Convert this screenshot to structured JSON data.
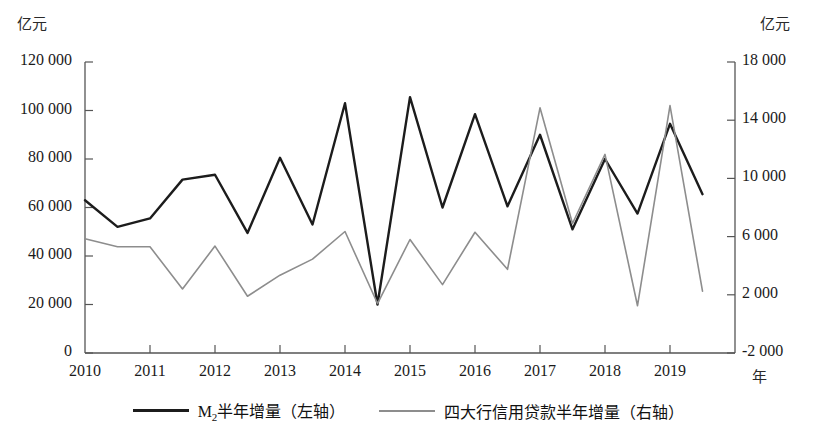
{
  "chart_data": {
    "type": "line",
    "title": "",
    "subtitle": "",
    "xlabel": "年",
    "ylabel_left": "亿元",
    "ylabel_right": "亿元",
    "grid": false,
    "legend_position": "bottom",
    "x_tick_labels": [
      "2010",
      "2011",
      "2012",
      "2013",
      "2014",
      "2015",
      "2016",
      "2017",
      "2018",
      "2019"
    ],
    "x_tick_values": [
      2010,
      2011,
      2012,
      2013,
      2014,
      2015,
      2016,
      2017,
      2018,
      2019
    ],
    "y_left_tick_labels": [
      "120 000",
      "100 000",
      "80 000",
      "60 000",
      "40 000",
      "20 000",
      "0"
    ],
    "y_left_tick_values": [
      120000,
      100000,
      80000,
      60000,
      40000,
      20000,
      0
    ],
    "y_right_tick_labels": [
      "18 000",
      "14 000",
      "10 000",
      "6 000",
      "2 000",
      "-2 000"
    ],
    "y_right_tick_values": [
      18000,
      14000,
      10000,
      6000,
      2000,
      -2000
    ],
    "ylim_left": [
      0,
      120000
    ],
    "ylim_right": [
      -2000,
      18000
    ],
    "xlim": [
      2010,
      2020
    ],
    "x": [
      2010.0,
      2010.5,
      2011.0,
      2011.5,
      2012.0,
      2012.5,
      2013.0,
      2013.5,
      2014.0,
      2014.5,
      2015.0,
      2015.5,
      2016.0,
      2016.5,
      2017.0,
      2017.5,
      2018.0,
      2018.5,
      2019.0,
      2019.5
    ],
    "x_period_labels": [
      "2010H1",
      "2010H2",
      "2011H1",
      "2011H2",
      "2012H1",
      "2012H2",
      "2013H1",
      "2013H2",
      "2014H1",
      "2014H2",
      "2015H1",
      "2015H2",
      "2016H1",
      "2016H2",
      "2017H1",
      "2017H2",
      "2018H1",
      "2018H2",
      "2019H1",
      "2019H2"
    ],
    "series": [
      {
        "name": "M₂半年增量（左轴）",
        "axis": "left",
        "color": "#1c1c1c",
        "width": 2.4,
        "values": [
          63000,
          52000,
          55500,
          71500,
          73500,
          49500,
          80500,
          53000,
          103000,
          20000,
          105500,
          60000,
          98500,
          60500,
          90000,
          51000,
          80000,
          57500,
          94500,
          65500
        ]
      },
      {
        "name": "四大行信用贷款半年增量（右轴）",
        "axis": "right",
        "color": "#8d8d8d",
        "width": 1.6,
        "values": [
          5850,
          5300,
          5300,
          2400,
          5350,
          1900,
          3350,
          4450,
          6350,
          1400,
          5800,
          2700,
          6300,
          3750,
          14850,
          6900,
          11650,
          1250,
          15000,
          2250
        ]
      }
    ]
  },
  "axes": {
    "left_unit": "亿元",
    "right_unit": "亿元",
    "x_unit": "年"
  },
  "legend": {
    "items": [
      {
        "label_prefix": "M",
        "label_sub": "2",
        "label_suffix": "半年增量（左轴）",
        "color": "#1c1c1c"
      },
      {
        "label_prefix": "",
        "label_sub": "",
        "label_suffix": "四大行信用贷款半年增量（右轴）",
        "color": "#8d8d8d"
      }
    ]
  }
}
